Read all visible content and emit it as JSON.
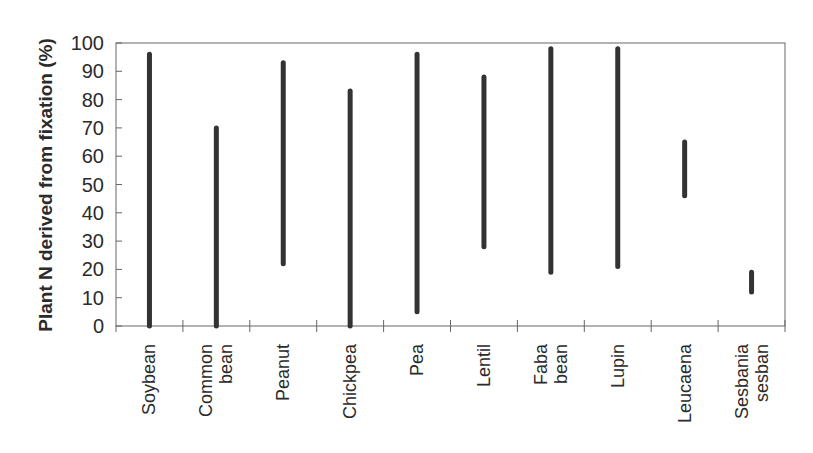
{
  "chart_data": {
    "type": "range-bar",
    "title": "",
    "xlabel": "",
    "ylabel": "Plant N derived from fixation (%)",
    "ylim": [
      0,
      100
    ],
    "yticks": [
      0,
      10,
      20,
      30,
      40,
      50,
      60,
      70,
      80,
      90,
      100
    ],
    "grid": false,
    "legend": null,
    "categories": [
      [
        "Soybean"
      ],
      [
        "Common",
        "bean"
      ],
      [
        "Peanut"
      ],
      [
        "Chickpea"
      ],
      [
        "Pea"
      ],
      [
        "Lentil"
      ],
      [
        "Faba",
        "bean"
      ],
      [
        "Lupin"
      ],
      [
        "Leucaena"
      ],
      [
        "Sesbania",
        "sesban"
      ]
    ],
    "series": [
      {
        "name": "Range of plant N derived from fixation (%)",
        "min": [
          0,
          0,
          22,
          0,
          5,
          28,
          19,
          21,
          46,
          12
        ],
        "max": [
          96,
          70,
          93,
          83,
          96,
          88,
          98,
          98,
          65,
          19
        ]
      }
    ],
    "colors": {
      "bar": "#333333",
      "axis": "#555555",
      "text": "#2b2b2b"
    }
  }
}
